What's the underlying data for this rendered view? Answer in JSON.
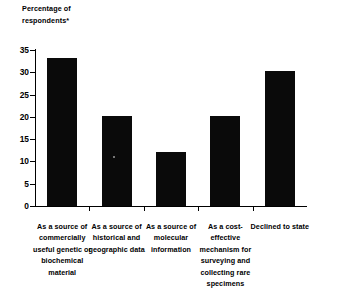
{
  "chart_data": {
    "type": "bar",
    "title": "",
    "axis_title": "Percentage of\nrespondents*",
    "xlabel": "",
    "ylabel": "Percentage of respondents*",
    "ylim": [
      0,
      35
    ],
    "yticks": [
      0,
      5,
      10,
      15,
      20,
      25,
      30,
      35
    ],
    "ytick_labels": [
      "0",
      "5",
      "10",
      "15",
      "20",
      "25",
      "30",
      "35"
    ],
    "grid": false,
    "legend": null,
    "bar_color": "#0a0a0a",
    "categories": [
      "As a source of\ncommercially\nuseful genetic or\nbiochemical\nmaterial",
      "As a source of\nhistorical and\ngeographic data",
      "As a source of\nmolecular\ninformation",
      "As a cost-\neffective\nmechanism for\nsurveying and\ncollecting rare\nspecimens",
      "Declined to state"
    ],
    "values": [
      33.1,
      20.1,
      12.1,
      20.2,
      30.3
    ]
  }
}
